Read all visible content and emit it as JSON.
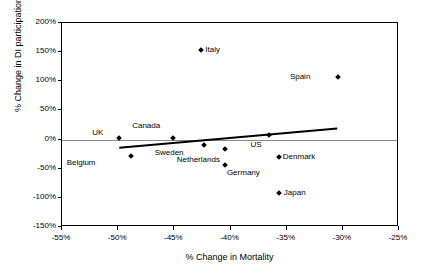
{
  "chart_data": {
    "type": "scatter",
    "title": "",
    "xlabel": "% Change in Mortality",
    "ylabel": "% Change in DI participation",
    "xlim": [
      -55,
      -25
    ],
    "ylim": [
      -150,
      200
    ],
    "xticks": [
      "-55%",
      "-50%",
      "-45%",
      "-40%",
      "-35%",
      "-30%",
      "-25%"
    ],
    "xtick_values": [
      -55,
      -50,
      -45,
      -40,
      -35,
      -30,
      -25
    ],
    "yticks": [
      "-150%",
      "-100%",
      "-50%",
      "0%",
      "50%",
      "100%",
      "150%",
      "200%"
    ],
    "ytick_values": [
      -150,
      -100,
      -50,
      0,
      50,
      100,
      150,
      200
    ],
    "grid": false,
    "legend": false,
    "zero_line": 0,
    "points": [
      {
        "label": "Italy",
        "x": -42.6,
        "y": 153,
        "label_dx": 5,
        "label_dy": -4
      },
      {
        "label": "Spain",
        "x": -30.4,
        "y": 108,
        "label_dx": -27,
        "label_dy": -4
      },
      {
        "label": "UK",
        "x": -49.9,
        "y": 2,
        "label_dx": -15,
        "label_dy": -9
      },
      {
        "label": "Canada",
        "x": -45.1,
        "y": 2,
        "label_dx": -12,
        "label_dy": -16
      },
      {
        "label": "US",
        "x": -36.6,
        "y": 7,
        "label_dx": -6,
        "label_dy": 6
      },
      {
        "label": "Sweden",
        "x": -42.4,
        "y": -10,
        "label_dx": -19,
        "label_dy": 4
      },
      {
        "label": "Netherlands",
        "x": -40.5,
        "y": -17,
        "label_dx": -4,
        "label_dy": 7
      },
      {
        "label": "Denmark",
        "x": -35.7,
        "y": -30,
        "label_dx": 5,
        "label_dy": -4
      },
      {
        "label": "Germany",
        "x": -40.5,
        "y": -43,
        "label_dx": 3,
        "label_dy": 4
      },
      {
        "label": "Belgium",
        "x": -48.9,
        "y": -28,
        "label_dx": -34,
        "label_dy": 3
      },
      {
        "label": "Japan",
        "x": -35.7,
        "y": -92,
        "label_dx": 6,
        "label_dy": -4
      }
    ],
    "trendline": {
      "x1": -49.9,
      "y1": -14,
      "x2": -30.5,
      "y2": 19
    }
  }
}
